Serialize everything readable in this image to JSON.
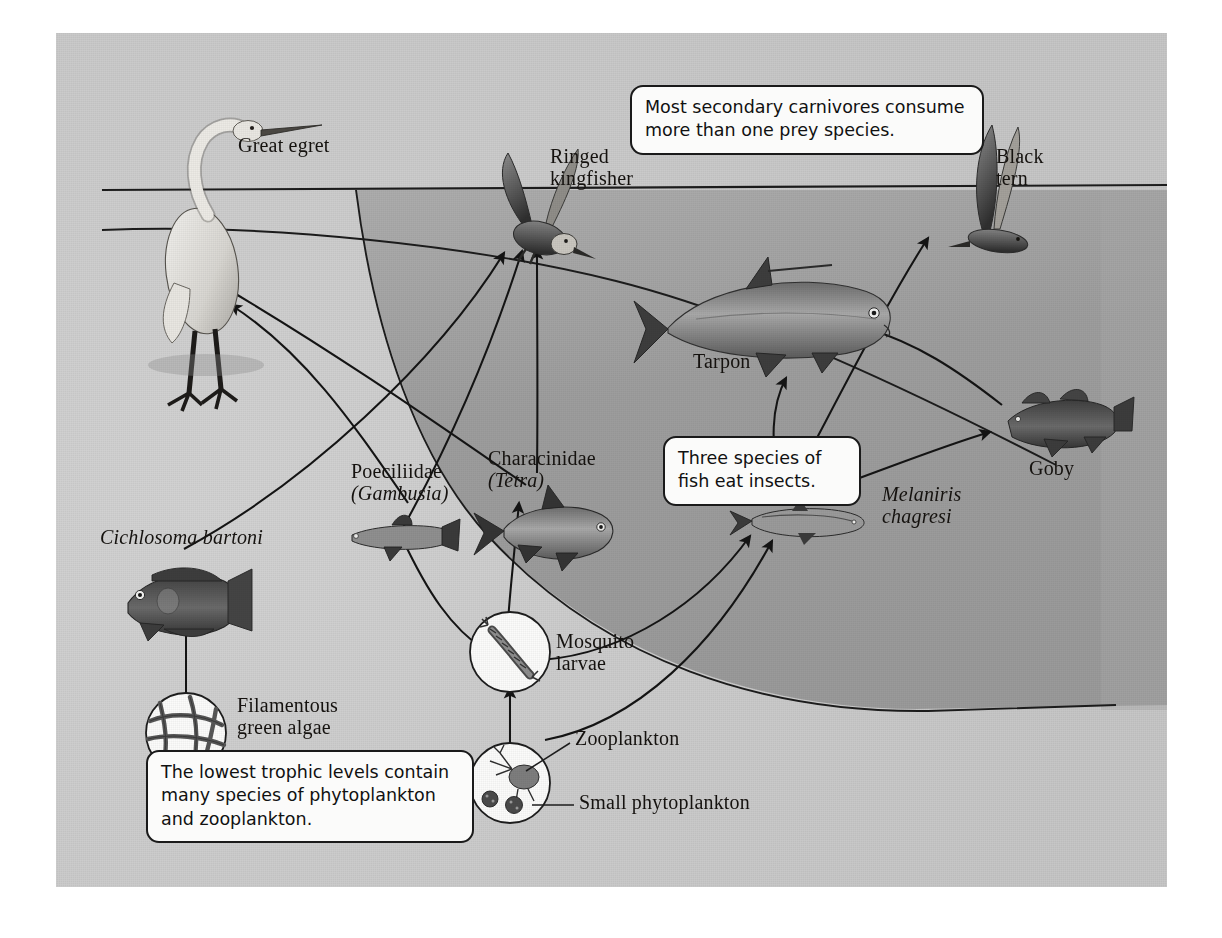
{
  "figure": {
    "panel": {
      "background_light": "#c9c9c9",
      "background_deep_water": "#9d9d9d",
      "border_color": "#1a1a1a"
    }
  },
  "callouts": [
    {
      "id": "secondary-carnivores",
      "text": "Most secondary carnivores consume\nmore than one prey species."
    },
    {
      "id": "three-species-fish",
      "text": "Three species of\nfish eat insects."
    },
    {
      "id": "lowest-trophic-levels",
      "text": "The lowest trophic levels contain\nmany species of phytoplankton\nand zooplankton."
    }
  ],
  "organisms": [
    {
      "id": "great-egret",
      "label": "Great egret",
      "style": "roman",
      "trophic": "top predator"
    },
    {
      "id": "ringed-kingfisher",
      "label": "Ringed\nkingfisher",
      "style": "roman",
      "trophic": "top predator"
    },
    {
      "id": "black-tern",
      "label": "Black\ntern",
      "style": "roman",
      "trophic": "top predator"
    },
    {
      "id": "tarpon",
      "label": "Tarpon",
      "style": "roman",
      "trophic": "secondary carnivore"
    },
    {
      "id": "goby",
      "label": "Goby",
      "style": "roman",
      "trophic": "secondary carnivore"
    },
    {
      "id": "cichlosoma-bartoni",
      "label": "Cichlosoma bartoni",
      "style": "italic",
      "trophic": "herbivore"
    },
    {
      "id": "poeciliidae",
      "label_line1": "Poeciliidae",
      "label_line2": "(Gambusia)",
      "style": "mixed",
      "trophic": "insectivore"
    },
    {
      "id": "characinidae",
      "label_line1": "Characinidae",
      "label_line2": "(Tetra)",
      "style": "mixed",
      "trophic": "insectivore"
    },
    {
      "id": "melaniris-chagresi",
      "label": "Melaniris\nchagresi",
      "style": "italic",
      "trophic": "insectivore"
    },
    {
      "id": "mosquito-larvae",
      "label": "Mosquito\nlarvae",
      "style": "roman",
      "trophic": "primary consumer"
    },
    {
      "id": "zooplankton",
      "label": "Zooplankton",
      "style": "roman",
      "trophic": "primary consumer"
    },
    {
      "id": "small-phytoplankton",
      "label": "Small phytoplankton",
      "style": "roman",
      "trophic": "producer"
    },
    {
      "id": "filamentous-green-algae",
      "label": "Filamentous\ngreen algae",
      "style": "roman",
      "trophic": "producer"
    }
  ],
  "feeding_links": [
    {
      "from": "filamentous-green-algae",
      "to": "cichlosoma-bartoni"
    },
    {
      "from": "small-phytoplankton",
      "to": "zooplankton"
    },
    {
      "from": "zooplankton",
      "to": "mosquito-larvae"
    },
    {
      "from": "zooplankton",
      "to": "melaniris-chagresi"
    },
    {
      "from": "mosquito-larvae",
      "to": "poeciliidae"
    },
    {
      "from": "mosquito-larvae",
      "to": "characinidae"
    },
    {
      "from": "mosquito-larvae",
      "to": "melaniris-chagresi"
    },
    {
      "from": "melaniris-chagresi",
      "to": "tarpon"
    },
    {
      "from": "melaniris-chagresi",
      "to": "black-tern"
    },
    {
      "from": "melaniris-chagresi",
      "to": "goby"
    },
    {
      "from": "goby",
      "to": "tarpon"
    },
    {
      "from": "poeciliidae",
      "to": "great-egret"
    },
    {
      "from": "characinidae",
      "to": "great-egret"
    },
    {
      "from": "poeciliidae",
      "to": "ringed-kingfisher"
    },
    {
      "from": "characinidae",
      "to": "ringed-kingfisher"
    },
    {
      "from": "cichlosoma-bartoni",
      "to": "ringed-kingfisher"
    }
  ]
}
